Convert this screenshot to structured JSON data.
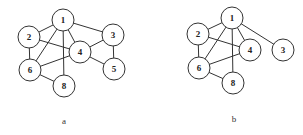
{
  "figure": {
    "node_radius": 11,
    "stroke_color": "#333333",
    "graphs": [
      {
        "id": "a",
        "caption": "a",
        "caption_pos": [
          64,
          121
        ],
        "nodes": [
          {
            "id": "1",
            "label": "1",
            "x": 63,
            "y": 20
          },
          {
            "id": "2",
            "label": "2",
            "x": 29,
            "y": 37
          },
          {
            "id": "3",
            "label": "3",
            "x": 113,
            "y": 35
          },
          {
            "id": "4",
            "label": "4",
            "x": 80,
            "y": 52
          },
          {
            "id": "5",
            "label": "5",
            "x": 114,
            "y": 69
          },
          {
            "id": "6",
            "label": "6",
            "x": 30,
            "y": 70
          },
          {
            "id": "8",
            "label": "8",
            "x": 64,
            "y": 86
          }
        ],
        "edges": [
          [
            "1",
            "2"
          ],
          [
            "1",
            "3"
          ],
          [
            "1",
            "4"
          ],
          [
            "1",
            "6"
          ],
          [
            "1",
            "8"
          ],
          [
            "2",
            "4"
          ],
          [
            "2",
            "6"
          ],
          [
            "3",
            "4"
          ],
          [
            "3",
            "5"
          ],
          [
            "4",
            "5"
          ],
          [
            "4",
            "6"
          ],
          [
            "6",
            "8"
          ]
        ]
      },
      {
        "id": "b",
        "caption": "b",
        "caption_pos": [
          234,
          119
        ],
        "nodes": [
          {
            "id": "1",
            "label": "1",
            "x": 232,
            "y": 18
          },
          {
            "id": "2",
            "label": "2",
            "x": 198,
            "y": 34
          },
          {
            "id": "3",
            "label": "3",
            "x": 283,
            "y": 50
          },
          {
            "id": "4",
            "label": "4",
            "x": 250,
            "y": 50
          },
          {
            "id": "6",
            "label": "6",
            "x": 199,
            "y": 68
          },
          {
            "id": "8",
            "label": "8",
            "x": 233,
            "y": 83
          }
        ],
        "edges": [
          [
            "1",
            "2"
          ],
          [
            "1",
            "3"
          ],
          [
            "1",
            "4"
          ],
          [
            "1",
            "6"
          ],
          [
            "1",
            "8"
          ],
          [
            "2",
            "4"
          ],
          [
            "2",
            "6"
          ],
          [
            "4",
            "6"
          ],
          [
            "6",
            "8"
          ]
        ]
      }
    ]
  }
}
